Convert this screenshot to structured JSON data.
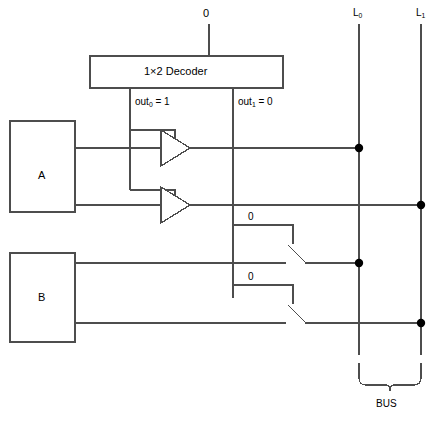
{
  "diagram": {
    "title_text": "Bus multiplexing with 1x2 decoder, tri-state buffers and switches",
    "decoder": {
      "label": "1×2 Decoder",
      "input_value": "0",
      "out0_label_prefix": "out",
      "out0_label_sub": "0",
      "out0_label_suffix": " = 1",
      "out1_label_prefix": "out",
      "out1_label_sub": "1",
      "out1_label_suffix": " = 0"
    },
    "blocks": [
      {
        "name": "A",
        "label": "A"
      },
      {
        "name": "B",
        "label": "B"
      }
    ],
    "switches": [
      {
        "name": "switch-upper",
        "control_value": "0",
        "state": "open"
      },
      {
        "name": "switch-lower",
        "control_value": "0",
        "state": "open"
      }
    ],
    "buses": [
      {
        "name": "L0",
        "prefix": "L",
        "sub": "0"
      },
      {
        "name": "L1",
        "prefix": "L",
        "sub": "1"
      }
    ],
    "bus_bracket_label": "BUS",
    "colors": {
      "line": "#4d4d4d",
      "box_stroke": "#4d4d4d",
      "dot": "#000000",
      "text": "#000000",
      "background": "#ffffff"
    }
  }
}
